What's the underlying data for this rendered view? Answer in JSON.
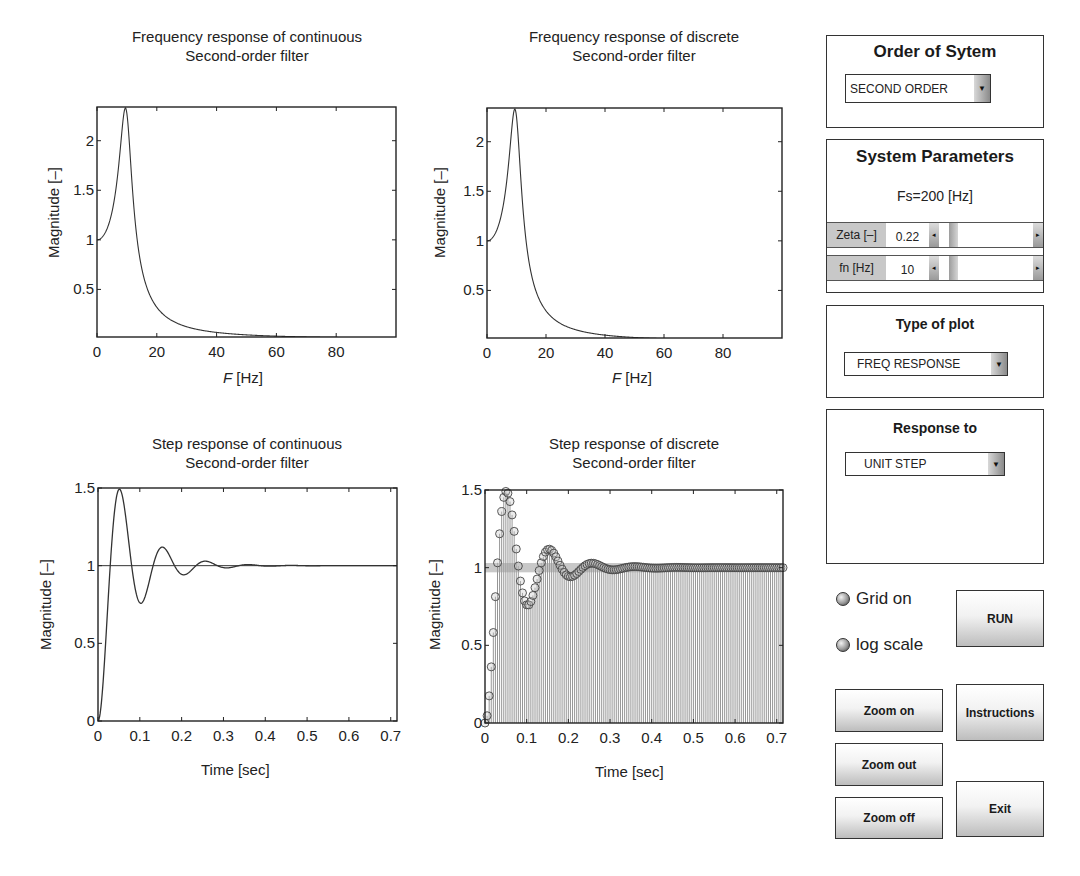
{
  "plots": {
    "freq_cont": {
      "title_line1": "Frequency response of continuous",
      "title_line2": "Second-order filter",
      "xlabel_italic": "F",
      "xlabel_rest": " [Hz]",
      "ylabel": "Magnitude [–]"
    },
    "freq_disc": {
      "title_line1": "Frequency response of discrete",
      "title_line2": "Second-order filter",
      "xlabel_italic": "F",
      "xlabel_rest": " [Hz]",
      "ylabel": "Magnitude [–]"
    },
    "step_cont": {
      "title_line1": "Step response of continuous",
      "title_line2": "Second-order filter",
      "xlabel": "Time [sec]",
      "ylabel": "Magnitude [–]"
    },
    "step_disc": {
      "title_line1": "Step response of discrete",
      "title_line2": "Second-order filter",
      "xlabel": "Time [sec]",
      "ylabel": "Magnitude [–]"
    }
  },
  "chart_data": [
    {
      "id": "freq_cont",
      "type": "line",
      "title": "Frequency response of continuous Second-order filter",
      "xlabel": "F [Hz]",
      "ylabel": "Magnitude [–]",
      "xlim": [
        0,
        100
      ],
      "ylim": [
        0.02,
        2.34
      ],
      "xticks": [
        0,
        20,
        40,
        60,
        80
      ],
      "yticks": [
        0.5,
        1,
        1.5,
        2
      ],
      "grid": false,
      "params": {
        "zeta": 0.22,
        "fn": 10
      },
      "x": [
        0,
        2,
        4,
        6,
        8,
        9.5,
        10,
        12,
        14,
        16,
        20,
        30,
        40,
        60,
        80,
        100
      ],
      "values": [
        1.0,
        1.04,
        1.17,
        1.46,
        2.0,
        2.33,
        2.27,
        1.36,
        0.83,
        0.57,
        0.33,
        0.12,
        0.067,
        0.028,
        0.016,
        0.01
      ]
    },
    {
      "id": "freq_disc",
      "type": "line",
      "title": "Frequency response of discrete Second-order filter",
      "xlabel": "F [Hz]",
      "ylabel": "Magnitude [–]",
      "xlim": [
        0,
        100
      ],
      "ylim": [
        0.02,
        2.34
      ],
      "xticks": [
        0,
        20,
        40,
        60,
        80
      ],
      "yticks": [
        0.5,
        1,
        1.5,
        2
      ],
      "grid": false,
      "params": {
        "zeta": 0.22,
        "fn": 10,
        "Fs": 200
      },
      "x": [
        0,
        2,
        4,
        6,
        8,
        9.5,
        10,
        12,
        14,
        16,
        20,
        30,
        40,
        60,
        80,
        100
      ],
      "values": [
        1.0,
        1.04,
        1.17,
        1.46,
        2.0,
        2.33,
        2.27,
        1.36,
        0.83,
        0.57,
        0.33,
        0.12,
        0.066,
        0.026,
        0.012,
        0.0
      ]
    },
    {
      "id": "step_cont",
      "type": "line",
      "title": "Step response of continuous Second-order filter",
      "xlabel": "Time [sec]",
      "ylabel": "Magnitude [–]",
      "xlim": [
        0,
        0.715
      ],
      "ylim": [
        0,
        1.5
      ],
      "xticks": [
        0,
        0.1,
        0.2,
        0.3,
        0.4,
        0.5,
        0.6,
        0.7
      ],
      "yticks": [
        0,
        0.5,
        1,
        1.5
      ],
      "grid": false,
      "reference_line": 1,
      "params": {
        "zeta": 0.22,
        "fn": 10
      },
      "x": [
        0,
        0.025,
        0.051,
        0.077,
        0.103,
        0.128,
        0.154,
        0.18,
        0.205,
        0.257,
        0.308,
        0.36,
        0.5,
        0.7
      ],
      "values": [
        0,
        0.73,
        1.49,
        1.21,
        0.76,
        0.93,
        1.12,
        1.03,
        0.94,
        1.03,
        0.985,
        1.007,
        1.0,
        1.0
      ]
    },
    {
      "id": "step_disc",
      "type": "stem",
      "title": "Step response of discrete Second-order filter",
      "xlabel": "Time [sec]",
      "ylabel": "Magnitude [–]",
      "xlim": [
        0,
        0.715
      ],
      "ylim": [
        0,
        1.5
      ],
      "xticks": [
        0,
        0.1,
        0.2,
        0.3,
        0.4,
        0.5,
        0.6,
        0.7
      ],
      "yticks": [
        0,
        0.5,
        1,
        1.5
      ],
      "grid": false,
      "marker": "circle",
      "sample_period": 0.005,
      "params": {
        "zeta": 0.22,
        "fn": 10,
        "Fs": 200
      },
      "x": [
        0,
        0.005,
        0.01,
        0.015,
        0.02,
        0.025,
        0.03,
        0.035,
        0.04,
        0.045,
        0.05,
        0.055,
        0.06,
        0.065,
        0.07,
        0.075,
        0.08,
        0.09,
        0.1,
        0.11,
        0.12,
        0.15,
        0.2,
        0.25,
        0.3,
        0.7
      ],
      "values": [
        0,
        0.1,
        0.26,
        0.47,
        0.7,
        0.92,
        1.12,
        1.29,
        1.41,
        1.48,
        1.49,
        1.46,
        1.38,
        1.28,
        1.16,
        1.05,
        0.94,
        0.8,
        0.76,
        0.8,
        0.9,
        1.11,
        0.93,
        1.03,
        0.985,
        1.0
      ]
    }
  ],
  "sidebar": {
    "order_panel": {
      "title": "Order of Sytem",
      "dropdown_value": "SECOND ORDER"
    },
    "params_panel": {
      "title": "System Parameters",
      "fs_text": "Fs=200 [Hz]",
      "rows": [
        {
          "label": "Zeta [–]",
          "value": "0.22"
        },
        {
          "label": "fn [Hz]",
          "value": "10"
        }
      ]
    },
    "plot_type_panel": {
      "title": "Type of plot",
      "dropdown_value": "FREQ RESPONSE"
    },
    "response_panel": {
      "title": "Response to",
      "dropdown_value": "UNIT STEP"
    },
    "radios": {
      "grid": "Grid on",
      "log": "log scale"
    },
    "buttons": {
      "run": "RUN",
      "zoom_on": "Zoom on",
      "zoom_out": "Zoom out",
      "zoom_off": "Zoom off",
      "instructions": "Instructions",
      "exit": "Exit"
    },
    "arrow_glyph": "▼",
    "left_glyph": "◂",
    "right_glyph": "▸"
  }
}
